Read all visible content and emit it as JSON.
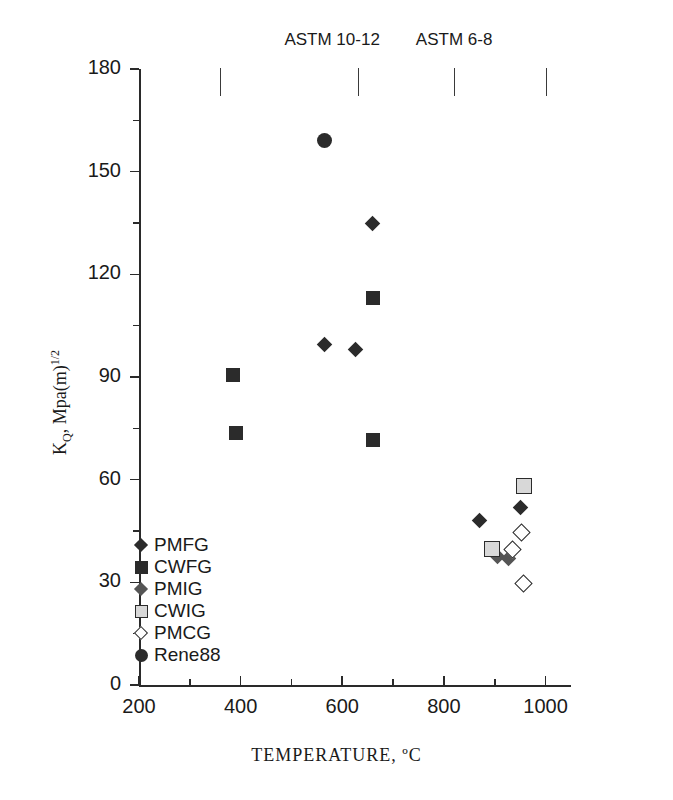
{
  "chart_data": {
    "type": "scatter",
    "title": "",
    "xlabel": "TEMPERATURE, ºC",
    "ylabel": "K_Q, Mpa(m)^1/2",
    "ylabel_parts": {
      "main": "K",
      "sub": "Q",
      "mid": ", Mpa(m)",
      "sup": "1/2"
    },
    "xlim": [
      200,
      1050
    ],
    "ylim": [
      0,
      180
    ],
    "xticks": [
      200,
      400,
      600,
      800,
      1000
    ],
    "xtick_labels": [
      "200",
      "400",
      "600",
      "800",
      "1000"
    ],
    "xminor_step": 100,
    "yticks": [
      0,
      30,
      60,
      90,
      120,
      150,
      180
    ],
    "ytick_labels": [
      "0",
      "30",
      "60",
      "90",
      "120",
      "150",
      "180"
    ],
    "yminor_step": 15,
    "grid": false,
    "legend_position": "inside-lower-left",
    "annotations": [
      {
        "text": "ASTM 10-12",
        "x_center": 580,
        "x_start": 360,
        "x_end": 630
      },
      {
        "text": "ASTM 6-8",
        "x_center": 820,
        "x_start": 820,
        "x_end": 1000
      }
    ],
    "series": [
      {
        "name": "PMFG",
        "marker": "diamond-filled",
        "points": [
          {
            "x": 565,
            "y": 99.5
          },
          {
            "x": 625,
            "y": 98
          },
          {
            "x": 660,
            "y": 135
          },
          {
            "x": 870,
            "y": 48
          },
          {
            "x": 950,
            "y": 52
          }
        ]
      },
      {
        "name": "CWFG",
        "marker": "square-filled",
        "points": [
          {
            "x": 385,
            "y": 90.5
          },
          {
            "x": 390,
            "y": 73.5
          },
          {
            "x": 660,
            "y": 113
          },
          {
            "x": 660,
            "y": 71.5
          }
        ]
      },
      {
        "name": "PMIG",
        "marker": "diamond-gray",
        "points": [
          {
            "x": 905,
            "y": 37.5
          },
          {
            "x": 928,
            "y": 37
          }
        ]
      },
      {
        "name": "CWIG",
        "marker": "square-light",
        "points": [
          {
            "x": 955,
            "y": 58.5
          },
          {
            "x": 893,
            "y": 40
          }
        ]
      },
      {
        "name": "PMCG",
        "marker": "diamond-open",
        "points": [
          {
            "x": 932,
            "y": 40
          },
          {
            "x": 950,
            "y": 45
          },
          {
            "x": 955,
            "y": 30
          }
        ]
      },
      {
        "name": "Rene88",
        "marker": "circle-filled",
        "points": [
          {
            "x": 565,
            "y": 159
          }
        ]
      }
    ],
    "legend": [
      {
        "label": "PMFG",
        "marker": "diamond-filled"
      },
      {
        "label": "CWFG",
        "marker": "square-filled"
      },
      {
        "label": "PMIG",
        "marker": "diamond-gray"
      },
      {
        "label": "CWIG",
        "marker": "square-light"
      },
      {
        "label": "PMCG",
        "marker": "diamond-open"
      },
      {
        "label": "Rene88",
        "marker": "circle-filled"
      }
    ],
    "colors": {
      "axis": "#2a2a2a",
      "text": "#1a1a1a",
      "marker_dark": "#2b2b2b",
      "marker_gray": "#555555",
      "marker_light": "#d8d8d8",
      "background": "#ffffff"
    }
  }
}
